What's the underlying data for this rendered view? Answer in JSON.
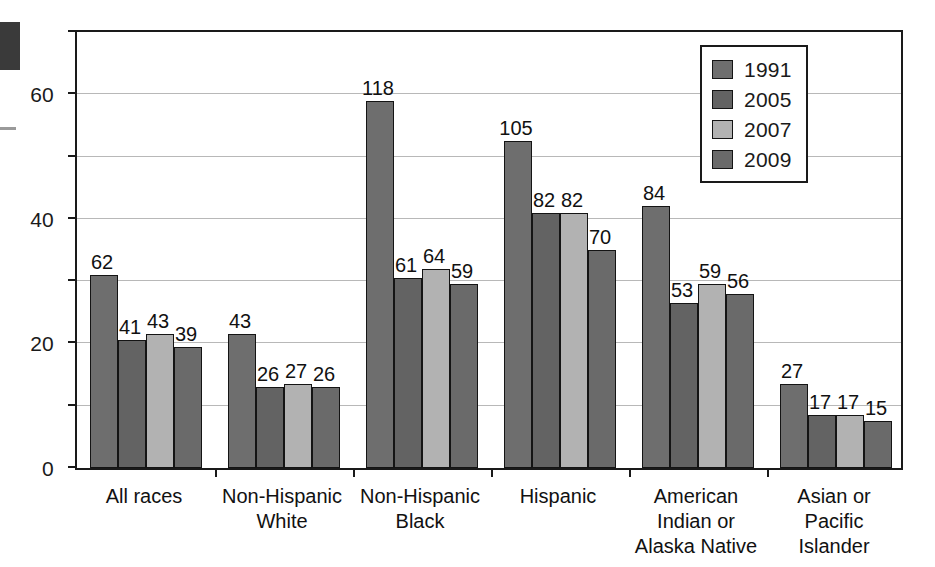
{
  "chart_data": {
    "type": "bar",
    "title": "",
    "subtitle": "",
    "xlabel": "",
    "ylabel": "",
    "ylim": [
      0,
      140
    ],
    "yticks": [
      0,
      20,
      40,
      60,
      80,
      100,
      120,
      140
    ],
    "grid": true,
    "legend_position": "top-right",
    "categories": [
      "All races",
      "Non-Hispanic\nWhite",
      "Non-Hispanic\nBlack",
      "Hispanic",
      "American\nIndian or\nAlaska Native",
      "Asian or\nPacific\nIslander"
    ],
    "series": [
      {
        "name": "1991",
        "color": "#6e6e6e",
        "values": [
          62,
          43,
          118,
          105,
          84,
          27
        ]
      },
      {
        "name": "2005",
        "color": "#636363",
        "values": [
          41,
          26,
          61,
          82,
          53,
          17
        ]
      },
      {
        "name": "2007",
        "color": "#b2b2b2",
        "values": [
          43,
          27,
          64,
          82,
          59,
          17
        ]
      },
      {
        "name": "2009",
        "color": "#6a6a6a",
        "values": [
          39,
          26,
          59,
          70,
          56,
          15
        ]
      }
    ]
  },
  "legend": {
    "items": [
      {
        "label": "1991",
        "color": "#6e6e6e"
      },
      {
        "label": "2005",
        "color": "#636363"
      },
      {
        "label": "2007",
        "color": "#b2b2b2"
      },
      {
        "label": "2009",
        "color": "#6a6a6a"
      }
    ]
  },
  "axis": {
    "y_tick_labels": [
      "0",
      "20",
      "40",
      "60",
      "80",
      "100",
      "120",
      "140"
    ]
  },
  "colors": {
    "axis": "#1a1a1a",
    "gridline": "#b8b8b8",
    "bar_outline": "#141414",
    "background": "#ffffff"
  }
}
